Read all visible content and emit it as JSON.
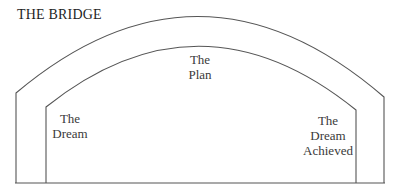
{
  "title": "THE BRIDGE",
  "labels": {
    "plan": [
      "The",
      "Plan"
    ],
    "dream": [
      "The",
      "Dream"
    ],
    "achieved": [
      "The",
      "Dream",
      "Achieved"
    ]
  },
  "colors": {
    "line": "#555555",
    "text": "#3a3a3a",
    "background": "#ffffff"
  }
}
